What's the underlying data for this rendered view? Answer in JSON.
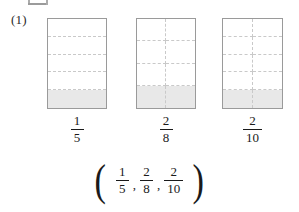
{
  "worksheet": {
    "problem_number": "(1)",
    "top_artifact": "partial-cut-off-mark"
  },
  "models": [
    {
      "id": "model-one-fifth",
      "columns": 1,
      "rows": 5,
      "shaded_cells": 1,
      "numerator": "1",
      "denominator": "5",
      "fraction_text": "1/5"
    },
    {
      "id": "model-two-eighths",
      "columns": 2,
      "rows": 4,
      "shaded_cells": 2,
      "numerator": "2",
      "denominator": "8",
      "fraction_text": "2/8"
    },
    {
      "id": "model-two-tenths",
      "columns": 2,
      "rows": 5,
      "shaded_cells": 2,
      "numerator": "2",
      "denominator": "10",
      "fraction_text": "2/10"
    }
  ],
  "answer": {
    "open_paren": "(",
    "close_paren": ")",
    "separator": ",",
    "terms": [
      {
        "numerator": "1",
        "denominator": "5"
      },
      {
        "numerator": "2",
        "denominator": "8"
      },
      {
        "numerator": "2",
        "denominator": "10"
      }
    ]
  },
  "colors": {
    "grid_border": "#9a9a9a",
    "grid_dashed": "#c9c9c9",
    "shade_fill": "#e8e8e8",
    "text": "#1a1a1a",
    "page_background": "#ffffff"
  }
}
